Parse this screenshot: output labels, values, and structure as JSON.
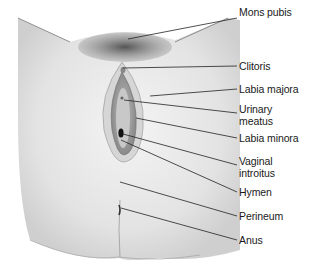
{
  "figure": {
    "type": "anatomical-illustration",
    "labels": [
      {
        "id": "mons-pubis",
        "text": "Mons pubis",
        "y": 12
      },
      {
        "id": "clitoris",
        "text": "Clitoris",
        "y": 60
      },
      {
        "id": "labia-majora",
        "text": "Labia majora",
        "y": 83
      },
      {
        "id": "urinary-meatus",
        "text": "Urinary\nmeatus",
        "y": 104
      },
      {
        "id": "labia-minora",
        "text": "Labia minora",
        "y": 132
      },
      {
        "id": "vaginal-introitus",
        "text": "Vaginal\nintroitus",
        "y": 159
      },
      {
        "id": "hymen",
        "text": "Hymen",
        "y": 189
      },
      {
        "id": "perineum",
        "text": "Perineum",
        "y": 212
      },
      {
        "id": "anus",
        "text": "Anus",
        "y": 235
      }
    ]
  }
}
